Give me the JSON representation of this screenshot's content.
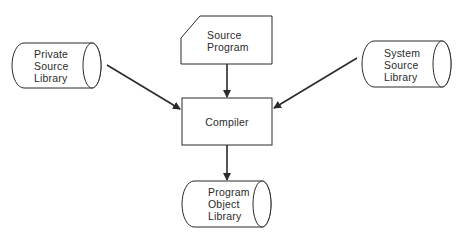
{
  "diagram": {
    "nodes": {
      "private_library": {
        "lines": [
          "Private",
          "Source",
          "Library"
        ],
        "shape": "cylinder"
      },
      "source_program": {
        "lines": [
          "Source",
          "Program"
        ],
        "shape": "card"
      },
      "system_library": {
        "lines": [
          "System",
          "Source",
          "Library"
        ],
        "shape": "cylinder"
      },
      "compiler": {
        "label": "Compiler",
        "shape": "rectangle"
      },
      "object_library": {
        "lines": [
          "Program",
          "Object",
          "Library"
        ],
        "shape": "cylinder"
      }
    },
    "edges": [
      {
        "from": "Private Source Library",
        "to": "Compiler"
      },
      {
        "from": "Source Program",
        "to": "Compiler"
      },
      {
        "from": "System Source Library",
        "to": "Compiler"
      },
      {
        "from": "Compiler",
        "to": "Program Object Library"
      }
    ],
    "colors": {
      "stroke": "#2a2a2a",
      "background": "#ffffff"
    }
  }
}
